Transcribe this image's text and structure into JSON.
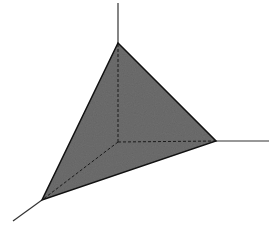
{
  "diagram": {
    "type": "3d-simplex",
    "colors": {
      "background": "#ffffff",
      "fill": "#6e6e6e",
      "stroke": "#111111",
      "axis": "#333333"
    },
    "origin": [
      118,
      142
    ],
    "vertices": {
      "top": [
        118,
        43
      ],
      "right": [
        216,
        141
      ],
      "bottom_left": [
        42,
        200
      ]
    },
    "axes_ends": {
      "z_up": [
        118,
        3
      ],
      "x_right": [
        269,
        141
      ],
      "y_down_left": [
        13,
        221
      ]
    }
  }
}
